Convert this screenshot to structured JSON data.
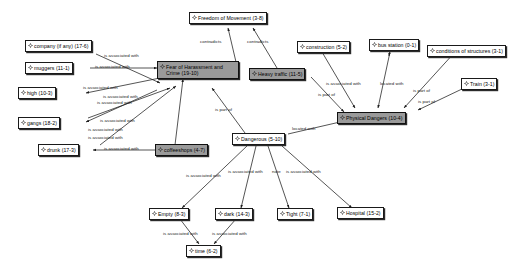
{
  "diagram": {
    "icon": "gear-icon",
    "colors": {
      "node_fill": "#ffffff",
      "node_fill_highlight": "#9a9a9a",
      "node_border": "#1a1a1a",
      "edge": "#1c1c1c",
      "background": "#ffffff"
    },
    "nodes": [
      {
        "id": "freedom",
        "label": "Freedom of Movement (3-8)",
        "highlight": false
      },
      {
        "id": "company",
        "label": "company (if any) (17-6)",
        "highlight": false
      },
      {
        "id": "muggers",
        "label": "muggers (11-1)",
        "highlight": false
      },
      {
        "id": "high",
        "label": "high (10-3)",
        "highlight": false
      },
      {
        "id": "gangs",
        "label": "gangs (18-2)",
        "highlight": false
      },
      {
        "id": "drunk",
        "label": "drunk (17-3)",
        "highlight": false
      },
      {
        "id": "fear",
        "label": "Fear of Harassment and Crime (19-10)",
        "highlight": true
      },
      {
        "id": "coffeeshops",
        "label": "coffeeshops (4-7)",
        "highlight": true
      },
      {
        "id": "heavytraffic",
        "label": "Heavy traffic (11-5)",
        "highlight": true
      },
      {
        "id": "construction",
        "label": "construction (5-2)",
        "highlight": false
      },
      {
        "id": "busstation",
        "label": "bus station (0-1)",
        "highlight": false
      },
      {
        "id": "conditions",
        "label": "conditions of structures (3-1)",
        "highlight": false
      },
      {
        "id": "train",
        "label": "Train (3-1)",
        "highlight": false
      },
      {
        "id": "physical",
        "label": "Physical Dangers (10-4)",
        "highlight": true
      },
      {
        "id": "dangerous",
        "label": "Dangerous (5-10)",
        "highlight": false
      },
      {
        "id": "empty",
        "label": "Empty (8-3)",
        "highlight": false
      },
      {
        "id": "dark",
        "label": "dark (14-3)",
        "highlight": false
      },
      {
        "id": "tight",
        "label": "Tight (7-1)",
        "highlight": false
      },
      {
        "id": "hospital",
        "label": "Hospital (15-2)",
        "highlight": false
      },
      {
        "id": "time",
        "label": "time (6-2)",
        "highlight": false
      }
    ],
    "edge_labels": [
      {
        "id": "el1",
        "text": "contradicts"
      },
      {
        "id": "el2",
        "text": "contradicts"
      },
      {
        "id": "el3",
        "text": "is associated with"
      },
      {
        "id": "el4",
        "text": "is associated with"
      },
      {
        "id": "el5",
        "text": "is associated with"
      },
      {
        "id": "el6",
        "text": "is associated with"
      },
      {
        "id": "el7",
        "text": "is associated with"
      },
      {
        "id": "el8",
        "text": "is associated with"
      },
      {
        "id": "el9",
        "text": "is associated with"
      },
      {
        "id": "el10",
        "text": "is associated with"
      },
      {
        "id": "el11",
        "text": "is associated with"
      },
      {
        "id": "el12",
        "text": "is associated with"
      },
      {
        "id": "el13",
        "text": "is associated with"
      },
      {
        "id": "el14",
        "text": "is associated with"
      },
      {
        "id": "el15",
        "text": "is associated with"
      },
      {
        "id": "el16",
        "text": "is associated with"
      },
      {
        "id": "el17",
        "text": "is associated with"
      },
      {
        "id": "el18",
        "text": "is part of"
      },
      {
        "id": "el19",
        "text": "is part of"
      },
      {
        "id": "el20",
        "text": "is part of"
      },
      {
        "id": "el21",
        "text": "is part of"
      },
      {
        "id": "el22",
        "text": "located with"
      },
      {
        "id": "el23",
        "text": "located with"
      },
      {
        "id": "el24",
        "text": "nate"
      }
    ]
  }
}
